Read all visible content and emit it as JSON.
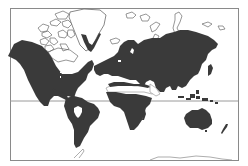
{
  "figure": {
    "type": "world-distribution-map",
    "projection": "Mercator",
    "caption": "",
    "legend": []
  },
  "colors": {
    "background": "#ffffff",
    "land_filled": "#3a3a3a",
    "land_outline": "#6a6a6a",
    "frame": "#8a8a8a",
    "equator": "#9a9a9a"
  },
  "regions": {
    "filled": [
      "North America (south of tundra)",
      "Central America",
      "South America",
      "Europe",
      "Asia",
      "North Africa (coastal)",
      "Sub-Saharan Africa",
      "Australia",
      "New Zealand",
      "Japan",
      "Southeast Asia islands",
      "Madagascar",
      "Greenland east coast strip"
    ],
    "outlined_only": [
      "Canadian Arctic Archipelago",
      "Greenland interior",
      "Svalbard",
      "Novaya Zemlya",
      "Siberian Arctic islands",
      "Antarctica",
      "Sahara band"
    ]
  }
}
